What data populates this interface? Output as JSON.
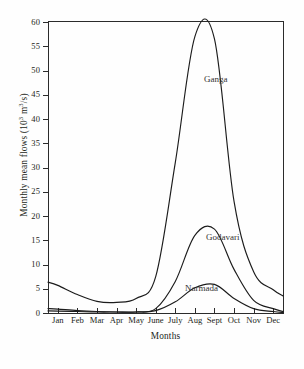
{
  "chart_data": {
    "type": "line",
    "title": "",
    "xlabel": "Months",
    "ylabel": "Monthly mean flows (10³ m³/s)",
    "ylabel_parts": {
      "pre": "Monthly mean flows (10",
      "sup1": "3",
      "mid": " m",
      "sup2": "3",
      "post": "/s)"
    },
    "categories": [
      "Jan",
      "Feb",
      "Mar",
      "Apr",
      "May",
      "June",
      "July",
      "Aug",
      "Sept",
      "Oct",
      "Nov",
      "Dec"
    ],
    "x": [
      1,
      2,
      3,
      4,
      5,
      6,
      7,
      8,
      9,
      10,
      11,
      12
    ],
    "xlim": [
      0.5,
      12.5
    ],
    "ylim": [
      0,
      60
    ],
    "yticks": [
      0,
      5,
      10,
      15,
      20,
      25,
      30,
      35,
      40,
      45,
      50,
      55,
      60
    ],
    "ytick_labels": [
      "0",
      "5",
      "10",
      "15",
      "20",
      "25",
      "30",
      "35",
      "40",
      "45",
      "50",
      "55",
      "60"
    ],
    "grid": false,
    "legend_position": "inline-annotations",
    "series": [
      {
        "name": "Ganga",
        "values": [
          5.7,
          3.8,
          2.4,
          2.2,
          3.0,
          7.5,
          31.0,
          57.0,
          56.5,
          23.0,
          8.5,
          4.8
        ],
        "peak_month": "Aug",
        "peak_value": 58
      },
      {
        "name": "Godavari",
        "values": [
          0.8,
          0.5,
          0.3,
          0.2,
          0.2,
          0.9,
          6.5,
          16.0,
          17.3,
          9.0,
          2.6,
          0.9
        ],
        "peak_month": "Sept",
        "peak_value": 17.5
      },
      {
        "name": "Narmada",
        "values": [
          0.4,
          0.3,
          0.2,
          0.2,
          0.2,
          0.5,
          2.3,
          5.2,
          5.9,
          3.0,
          0.9,
          0.3
        ],
        "peak_month": "Sept",
        "peak_value": 6
      }
    ],
    "annotations": [
      {
        "text": "Ganga",
        "series": "Ganga"
      },
      {
        "text": "Godavari",
        "series": "Godavari"
      },
      {
        "text": "Narmada",
        "series": "Narmada"
      }
    ],
    "colors": {
      "line": "#1c1c1c",
      "background": "#ffffff",
      "axis": "#2b2b2b"
    }
  }
}
